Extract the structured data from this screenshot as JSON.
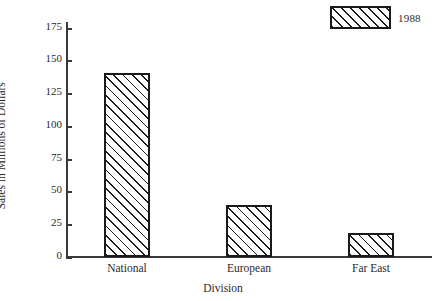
{
  "chart_data": {
    "type": "bar",
    "title": "",
    "categories": [
      "National",
      "European",
      "Far East"
    ],
    "values": [
      140,
      40,
      18
    ],
    "series": [
      {
        "name": "1988",
        "values": [
          140,
          40,
          18
        ]
      }
    ],
    "xlabel": "Division",
    "ylabel": "Sales in Millions of Dollars",
    "ylim": [
      0,
      180
    ],
    "yticks": [
      0,
      25,
      50,
      75,
      100,
      125,
      150,
      175
    ],
    "ytick_labels": [
      "0",
      "25",
      "50",
      "75",
      "100",
      "125",
      "150",
      "175"
    ],
    "grid": false,
    "legend": {
      "position": "top-right",
      "entries": [
        {
          "label": "1988",
          "pattern": "diagonal-hatch",
          "color": "#1a1a1a"
        }
      ]
    },
    "style": {
      "bar_fill": "#ffffff",
      "bar_edge": "#1a1a1a",
      "hatch": "diagonal-45",
      "axis_color": "#3a3a3a",
      "background": "#ffffff"
    }
  }
}
